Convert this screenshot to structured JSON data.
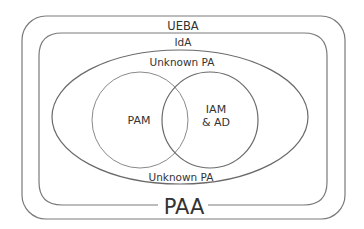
{
  "diagram": {
    "outer_box": {
      "label": "UEBA"
    },
    "inner_box": {
      "label": "IdA"
    },
    "ellipse": {
      "label_top": "Unknown PA",
      "label_bottom": "Unknown PA"
    },
    "circle_left": {
      "label": "PAM"
    },
    "circle_right": {
      "label_line1": "IAM",
      "label_line2": "& AD"
    },
    "bottom_label": "PAA"
  },
  "colors": {
    "stroke": "#7a7a7a",
    "text": "#333333",
    "background": "#ffffff"
  }
}
